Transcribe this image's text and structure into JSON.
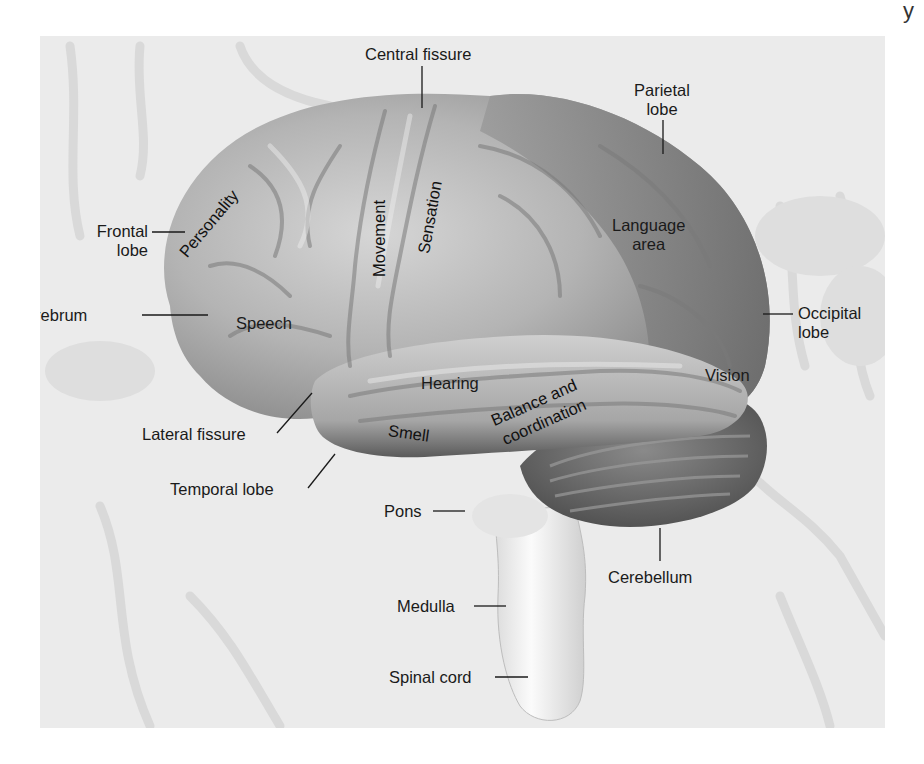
{
  "figure": {
    "structure_labels": {
      "central_fissure": "Central fissure",
      "parietal_lobe": [
        "Parietal",
        "lobe"
      ],
      "frontal_lobe": [
        "Frontal",
        "lobe"
      ],
      "cerebrum": "Cerebrum",
      "occipital_lobe": [
        "Occipital",
        "lobe"
      ],
      "lateral_fissure": "Lateral fissure",
      "temporal_lobe": "Temporal lobe",
      "pons": "Pons",
      "cerebellum": "Cerebellum",
      "medulla": "Medulla",
      "spinal_cord": "Spinal cord"
    },
    "function_labels": {
      "personality": "Personality",
      "movement": "Movement",
      "sensation": "Sensation",
      "language": [
        "Language",
        "area"
      ],
      "speech": "Speech",
      "hearing": "Hearing",
      "vision": "Vision",
      "smell": "Smell",
      "balance": [
        "Balance and",
        "coordination"
      ]
    },
    "colors": {
      "background_panel": "#ebebeb",
      "frontal_light": "#c8c8c8",
      "parietal_dark": "#7a7a7a",
      "cerebellum": "#5e5e5e",
      "brainstem": "#f2f2f2",
      "label_text": "#1a1a1a"
    }
  },
  "page": {
    "stray_glyph": "y"
  }
}
